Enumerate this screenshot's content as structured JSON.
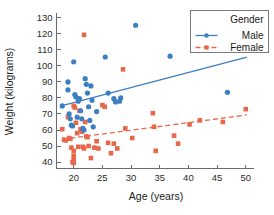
{
  "chart_data": {
    "type": "scatter",
    "title": "",
    "xlabel": "Age (years)",
    "ylabel": "Weight (kilograms)",
    "xlim": [
      17,
      51
    ],
    "ylim": [
      36,
      132
    ],
    "xticks": [
      20,
      25,
      30,
      35,
      40,
      45,
      50
    ],
    "yticks": [
      40,
      50,
      60,
      70,
      80,
      90,
      100,
      110,
      120,
      130
    ],
    "grid": false,
    "legend": {
      "title": "Gender",
      "position": "top-right",
      "entries": [
        {
          "name": "Male",
          "color": "#3c7fc0",
          "marker": "circle",
          "line": "solid"
        },
        {
          "name": "Female",
          "color": "#e8674a",
          "marker": "square",
          "line": "dashed"
        }
      ]
    },
    "series": [
      {
        "name": "Male",
        "color": "#3c7fc0",
        "marker": "circle",
        "points": [
          [
            18.0,
            75.0
          ],
          [
            19.0,
            90.0
          ],
          [
            19.0,
            85.0
          ],
          [
            19.2,
            70.0
          ],
          [
            19.4,
            67.0
          ],
          [
            19.6,
            63.0
          ],
          [
            19.8,
            62.5
          ],
          [
            20.0,
            102.5
          ],
          [
            20.2,
            82.0
          ],
          [
            20.4,
            80.5
          ],
          [
            20.6,
            68.0
          ],
          [
            20.8,
            78.0
          ],
          [
            21.0,
            79.5
          ],
          [
            21.2,
            72.0
          ],
          [
            21.4,
            67.0
          ],
          [
            21.6,
            61.0
          ],
          [
            21.8,
            60.0
          ],
          [
            22.0,
            92.0
          ],
          [
            22.2,
            88.5
          ],
          [
            22.4,
            83.0
          ],
          [
            22.6,
            74.5
          ],
          [
            22.8,
            66.0
          ],
          [
            23.0,
            87.5
          ],
          [
            23.2,
            78.5
          ],
          [
            23.4,
            62.0
          ],
          [
            24.0,
            71.5
          ],
          [
            25.5,
            105.5
          ],
          [
            26.0,
            83.0
          ],
          [
            27.0,
            79.5
          ],
          [
            27.3,
            77.5
          ],
          [
            28.0,
            78.0
          ],
          [
            28.2,
            80.0
          ],
          [
            30.8,
            125.3
          ],
          [
            36.8,
            106.0
          ],
          [
            46.8,
            83.5
          ]
        ]
      },
      {
        "name": "Female",
        "color": "#e8674a",
        "marker": "square",
        "points": [
          [
            18.0,
            60.5
          ],
          [
            18.3,
            54.0
          ],
          [
            18.6,
            53.5
          ],
          [
            19.0,
            68.0
          ],
          [
            19.2,
            55.0
          ],
          [
            19.4,
            54.5
          ],
          [
            19.6,
            49.0
          ],
          [
            20.0,
            75.0
          ],
          [
            20.2,
            74.0
          ],
          [
            20.4,
            64.5
          ],
          [
            20.6,
            58.0
          ],
          [
            20.8,
            49.5
          ],
          [
            20.0,
            47.0
          ],
          [
            20.0,
            44.0
          ],
          [
            20.0,
            41.5
          ],
          [
            20.0,
            39.5
          ],
          [
            19.8,
            40.0
          ],
          [
            21.0,
            72.0
          ],
          [
            21.2,
            60.5
          ],
          [
            21.4,
            59.0
          ],
          [
            21.6,
            49.5
          ],
          [
            21.8,
            48.5
          ],
          [
            21.8,
            119.3
          ],
          [
            22.0,
            65.0
          ],
          [
            22.2,
            56.0
          ],
          [
            22.4,
            55.5
          ],
          [
            22.6,
            50.0
          ],
          [
            23.0,
            42.5
          ],
          [
            23.6,
            49.0
          ],
          [
            24.0,
            53.0
          ],
          [
            24.3,
            48.5
          ],
          [
            25.0,
            75.5
          ],
          [
            25.4,
            74.5
          ],
          [
            26.0,
            52.0
          ],
          [
            26.5,
            45.5
          ],
          [
            27.0,
            51.5
          ],
          [
            27.6,
            48.5
          ],
          [
            28.6,
            97.8
          ],
          [
            29.0,
            61.0
          ],
          [
            30.2,
            55.0
          ],
          [
            33.8,
            70.5
          ],
          [
            34.0,
            62.0
          ],
          [
            34.3,
            47.0
          ],
          [
            37.5,
            56.5
          ],
          [
            38.2,
            51.5
          ],
          [
            40.2,
            63.5
          ],
          [
            42.0,
            66.0
          ],
          [
            46.0,
            65.0
          ],
          [
            50.0,
            73.0
          ]
        ]
      }
    ],
    "fit_lines": [
      {
        "name": "Male",
        "color": "#3c7fc0",
        "style": "solid",
        "x0": 18.0,
        "y0": 75.2,
        "x1": 50.2,
        "y1": 105.5
      },
      {
        "name": "Female",
        "color": "#e8674a",
        "style": "dashed",
        "x0": 18.0,
        "y0": 54.2,
        "x1": 50.2,
        "y1": 69.4
      }
    ]
  }
}
